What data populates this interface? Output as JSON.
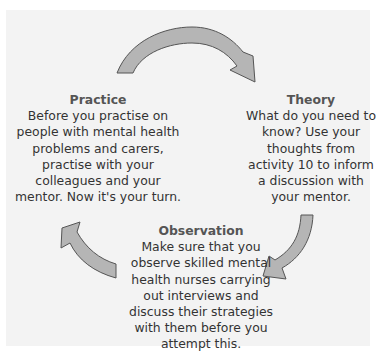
{
  "diagram": {
    "type": "cycle",
    "colors": {
      "background": "#f3f3f3",
      "arrow_fill": "#b5b5b5",
      "arrow_stroke": "#555555",
      "title_text": "#555555",
      "body_text": "#333333"
    },
    "arrows": [
      {
        "name": "practice-to-theory",
        "from": "Practice",
        "to": "Theory"
      },
      {
        "name": "theory-to-observation",
        "from": "Theory",
        "to": "Observation"
      },
      {
        "name": "observation-to-practice",
        "from": "Observation",
        "to": "Practice"
      }
    ],
    "stages": {
      "practice": {
        "title": "Practice",
        "text": "Before you practise on people with mental health problems and carers, practise with your colleagues and your mentor. Now it's your turn."
      },
      "theory": {
        "title": "Theory",
        "text": "What do you need to know? Use your thoughts from activity 10 to inform a discussion with your mentor."
      },
      "observation": {
        "title": "Observation",
        "text": "Make sure that you observe skilled mental health nurses carrying out interviews and discuss their strategies with them before you attempt this."
      }
    }
  }
}
